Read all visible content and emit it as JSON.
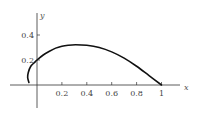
{
  "chart_data": {
    "type": "line",
    "title": "",
    "xlabel": "x",
    "ylabel": "y",
    "xlim": [
      -0.1,
      1.1
    ],
    "ylim": [
      -0.18,
      0.58
    ],
    "grid": false,
    "legend": null,
    "x_ticks": [
      0.2,
      0.4,
      0.6,
      0.8,
      1
    ],
    "x_tick_labels": [
      "0.2",
      "0.4",
      "0.6",
      "0.8",
      "1"
    ],
    "y_ticks": [
      0.2,
      0.4
    ],
    "y_tick_labels": [
      "0.2",
      "0.4"
    ],
    "series": [
      {
        "name": "curve",
        "points": [
          [
            -0.065,
            0.02
          ],
          [
            -0.075,
            0.06
          ],
          [
            -0.07,
            0.1
          ],
          [
            -0.05,
            0.15
          ],
          [
            -0.02,
            0.18
          ],
          [
            0.0,
            0.2
          ],
          [
            0.05,
            0.24
          ],
          [
            0.1,
            0.27
          ],
          [
            0.15,
            0.295
          ],
          [
            0.2,
            0.31
          ],
          [
            0.25,
            0.318
          ],
          [
            0.31,
            0.322
          ],
          [
            0.4,
            0.318
          ],
          [
            0.5,
            0.3
          ],
          [
            0.6,
            0.265
          ],
          [
            0.7,
            0.215
          ],
          [
            0.8,
            0.15
          ],
          [
            0.9,
            0.075
          ],
          [
            1.0,
            0.0
          ]
        ]
      }
    ]
  }
}
